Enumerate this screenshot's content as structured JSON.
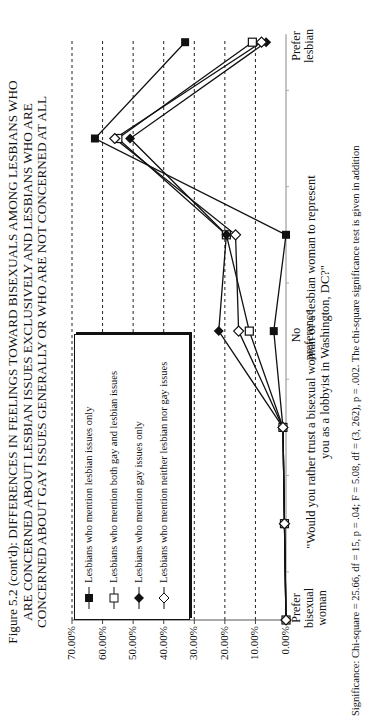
{
  "title": {
    "line1": "Figure 5.2 (cont'd):  DIFFERENCES IN FEELINGS TOWARD BISEXUALS AMONG LESBIANS WHO",
    "line2": "ARE CONCERNED ABOUT LESBIAN ISSUES EXCLUSIVELY AND LESBIANS WHO ARE",
    "line3": "CONCERNED ABOUT GAY ISSUES GENERALLY OR WHO ARE NOT CONCERNED AT ALL"
  },
  "legend": {
    "items": [
      {
        "label": "Lesbians who mention lesbian issues only",
        "marker": "filled-square"
      },
      {
        "label": "Lesbians who mention both gay and lesbian issues",
        "marker": "open-square"
      },
      {
        "label": "Lesbians who mention gay issues only",
        "marker": "filled-diamond"
      },
      {
        "label": "Lesbians who mention neither lesbian nor gay issues",
        "marker": "open-diamond"
      }
    ]
  },
  "axis": {
    "y_ticks": [
      "70.00%",
      "60.00%",
      "50.00%",
      "40.00%",
      "30.00%",
      "20.00%",
      "10.00%",
      "0.00%"
    ],
    "x_labels": {
      "left": "Prefer bisexual woman",
      "left_lines": [
        "Prefer",
        "bisexual",
        "woman"
      ],
      "middle_lines": [
        "No",
        "preference"
      ],
      "right_lines": [
        "Prefer",
        "lesbian"
      ]
    },
    "x_title_line1": "\"Would you rather trust a bisexual woman or a lesbian woman to represent",
    "x_title_line2": "you as a lobbyist in Washington, DC?\""
  },
  "significance": "Significance:  Chi-square = 25.66, df = 15, p = .04; F = 5.08, df = (3, 262), p = .002.  The chi-square significance test is given in addition",
  "chart_data": {
    "type": "line",
    "xlabel": "\"Would you rather trust a bisexual woman or a lesbian woman to represent you as a lobbyist in Washington, DC?\"",
    "ylabel": "",
    "categories": [
      "Prefer bisexual woman",
      "2",
      "3",
      "No preference",
      "5",
      "6",
      "Prefer lesbian"
    ],
    "ylim": [
      0,
      70
    ],
    "y_format": "percent",
    "grid": "horizontal dashed",
    "legend_position": "upper-left inside",
    "orientation_note": "page printed rotated 90 degrees",
    "series": [
      {
        "name": "Lesbians who mention lesbian issues only",
        "marker": "filled-square",
        "values": [
          0.0,
          0.5,
          1.0,
          4.0,
          0.0,
          62.5,
          33.0
        ]
      },
      {
        "name": "Lesbians who mention both gay and lesbian issues",
        "marker": "open-square",
        "values": [
          0.0,
          0.5,
          1.0,
          12.0,
          19.5,
          55.0,
          11.0
        ]
      },
      {
        "name": "Lesbians who mention gay issues only",
        "marker": "filled-diamond",
        "values": [
          0.0,
          0.5,
          1.0,
          22.0,
          19.5,
          51.0,
          6.5
        ]
      },
      {
        "name": "Lesbians who mention neither lesbian nor gay issues",
        "marker": "open-diamond",
        "values": [
          0.0,
          0.5,
          1.0,
          15.5,
          16.5,
          56.0,
          8.0
        ]
      }
    ]
  }
}
